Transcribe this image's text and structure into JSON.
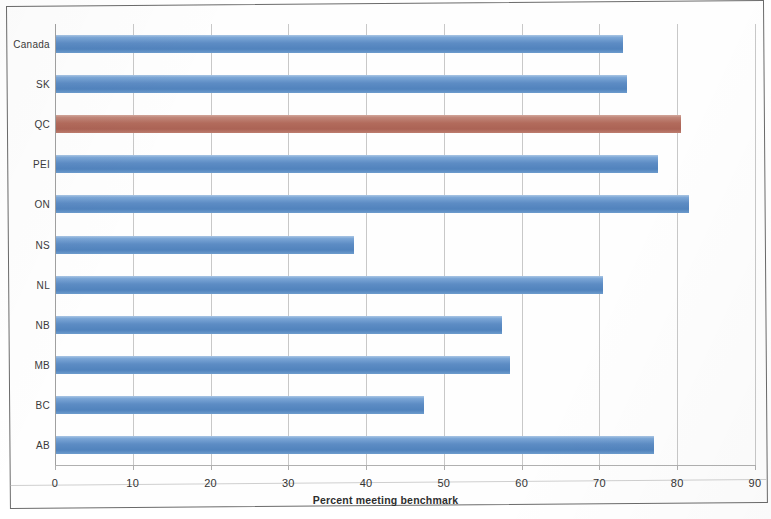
{
  "chart_data": {
    "type": "bar",
    "orientation": "horizontal",
    "title": "",
    "xlabel": "Percent meeting benchmark",
    "ylabel": "",
    "xlim": [
      0,
      90
    ],
    "xticks": [
      0,
      10,
      20,
      30,
      40,
      50,
      60,
      70,
      80,
      90
    ],
    "grid": true,
    "legend": "none",
    "categories": [
      "AB",
      "BC",
      "MB",
      "NB",
      "NL",
      "NS",
      "ON",
      "PEI",
      "QC",
      "SK",
      "Canada"
    ],
    "values": [
      77,
      47.5,
      58.5,
      57.5,
      70.5,
      38.5,
      81.5,
      77.5,
      80.5,
      73.5,
      73
    ],
    "bars": [
      {
        "category": "Canada",
        "value": 73,
        "color": "#5d8cc4",
        "highlight": false
      },
      {
        "category": "SK",
        "value": 73.5,
        "color": "#5d8cc4",
        "highlight": false
      },
      {
        "category": "QC",
        "value": 80.5,
        "color": "#b26b5c",
        "highlight": true
      },
      {
        "category": "PEI",
        "value": 77.5,
        "color": "#5d8cc4",
        "highlight": false
      },
      {
        "category": "ON",
        "value": 81.5,
        "color": "#5d8cc4",
        "highlight": false
      },
      {
        "category": "NS",
        "value": 38.5,
        "color": "#5d8cc4",
        "highlight": false
      },
      {
        "category": "NL",
        "value": 70.5,
        "color": "#5d8cc4",
        "highlight": false
      },
      {
        "category": "NB",
        "value": 57.5,
        "color": "#5d8cc4",
        "highlight": false
      },
      {
        "category": "MB",
        "value": 58.5,
        "color": "#5d8cc4",
        "highlight": false
      },
      {
        "category": "BC",
        "value": 47.5,
        "color": "#5d8cc4",
        "highlight": false
      },
      {
        "category": "AB",
        "value": 77,
        "color": "#5d8cc4",
        "highlight": false
      }
    ],
    "colors": {
      "bar": "#5d8cc4",
      "bar_highlight": "#b26b5c",
      "gridline": "#c8c8c8",
      "axis": "#a0a0a0",
      "text": "#333333"
    }
  },
  "axis": {
    "x_title": "Percent meeting benchmark",
    "tick_labels": [
      "0",
      "10",
      "20",
      "30",
      "40",
      "50",
      "60",
      "70",
      "80",
      "90"
    ]
  }
}
